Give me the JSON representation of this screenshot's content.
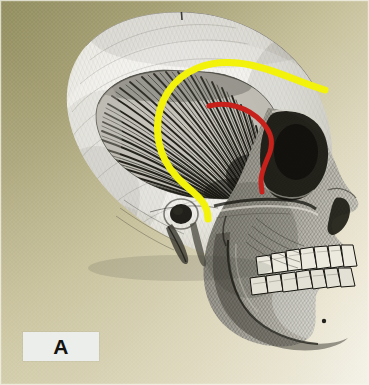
{
  "figure": {
    "panel_label": "A",
    "canvas": {
      "width": 369,
      "height": 385
    }
  },
  "colors": {
    "annotation_yellow": "#F2F20A",
    "annotation_red": "#C8201A",
    "background_olive": "#8C8858",
    "background_khaki": "#C8C19C",
    "background_cream": "#EFEADC",
    "background_white": "#FBFAF6",
    "bone_light": "#F0EFEA",
    "bone_mid": "#BFBDB4",
    "ink_dark": "#1B1A17",
    "label_box_fill": "#ECEEEC",
    "label_text": "#14130F"
  },
  "annotations": [
    {
      "name": "yellow-curve",
      "color_key": "annotation_yellow",
      "stroke_width": 7,
      "meaning": "superior temporal line / temporalis origin outline",
      "path": "M 325 90 C 300 83, 268 66, 238 63 C 208 60, 182 70, 168 92 C 154 114, 155 140, 165 160 C 175 180, 193 190, 201 200 C 207 207, 208 213, 208 219"
    },
    {
      "name": "red-curve",
      "color_key": "annotation_red",
      "stroke_width": 5,
      "meaning": "deep temporal fascia / inner boundary marking",
      "path": "M 209 106 C 226 101, 248 107, 262 122 C 272 133, 273 142, 270 152 C 266 163, 261 171, 261 181 C 261 187, 262 190, 262 192"
    }
  ],
  "anatomy_labels": [
    "cranial vault",
    "temporal fossa",
    "temporalis muscle",
    "zygomatic arch",
    "orbit",
    "nasal aperture",
    "maxilla",
    "mandible",
    "maxillary teeth",
    "mandibular teeth",
    "external acoustic meatus",
    "mastoid process",
    "styloid process",
    "occipital region"
  ]
}
